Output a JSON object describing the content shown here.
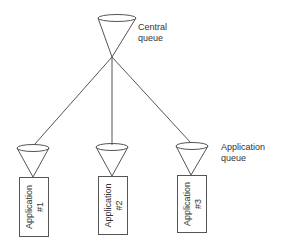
{
  "diagram": {
    "central_queue": {
      "label_line1": "Central",
      "label_line2": "queue"
    },
    "application_queue_label": {
      "line1": "Application",
      "line2": "queue"
    },
    "applications": [
      {
        "name": "Application",
        "number": "#1"
      },
      {
        "name": "Application",
        "number": "#2"
      },
      {
        "name": "Application",
        "number": "#3"
      }
    ],
    "colors": {
      "stroke": "#555555",
      "text": "#333333",
      "background": "#ffffff"
    }
  }
}
